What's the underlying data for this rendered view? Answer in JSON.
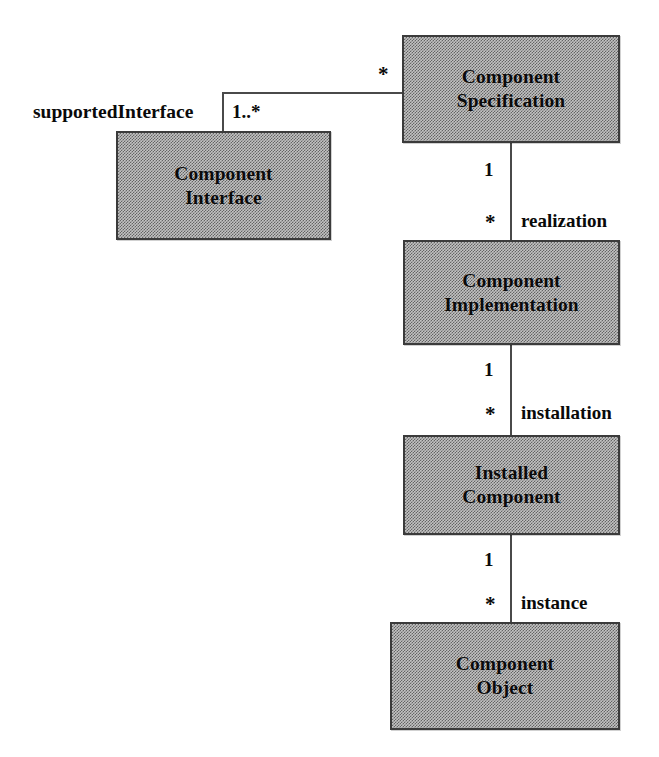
{
  "diagram": {
    "kind": "uml-class-diagram",
    "boxes": [
      {
        "id": "component-specification",
        "label": "Component\nSpecification"
      },
      {
        "id": "component-interface",
        "label": "Component\nInterface"
      },
      {
        "id": "component-implementation",
        "label": "Component\nImplementation"
      },
      {
        "id": "installed-component",
        "label": "Installed\nComponent"
      },
      {
        "id": "component-object",
        "label": "Component\nObject"
      }
    ],
    "associations": [
      {
        "id": "supported-interface",
        "role": "supportedInterface",
        "source_multiplicity": "*",
        "target_multiplicity": "1..*"
      },
      {
        "id": "realization",
        "role": "realization",
        "source_multiplicity": "1",
        "target_multiplicity": "*"
      },
      {
        "id": "installation",
        "role": "installation",
        "source_multiplicity": "1",
        "target_multiplicity": "*"
      },
      {
        "id": "instance",
        "role": "instance",
        "source_multiplicity": "1",
        "target_multiplicity": "*"
      }
    ],
    "colors": {
      "box_fill": "#c2c2c2",
      "box_border": "#3b3b3b",
      "line": "#4a4a4a",
      "text": "#0a0a0a",
      "background": "#ffffff"
    }
  }
}
